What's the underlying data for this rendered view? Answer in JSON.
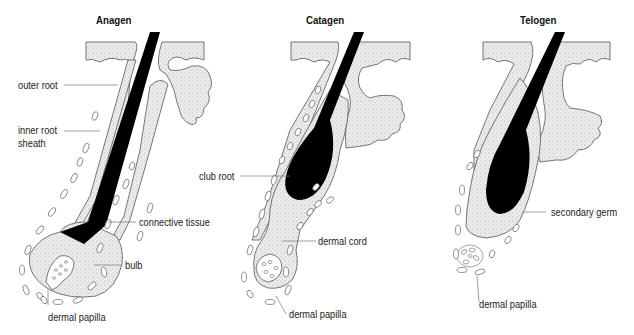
{
  "figure": {
    "panels": [
      {
        "title": "Anagen",
        "labels": [
          "outer root",
          "inner root\nsheath",
          "connective tissue",
          "bulb",
          "dermal papilla"
        ]
      },
      {
        "title": "Catagen",
        "labels": [
          "club root",
          "dermal cord",
          "dermal papilla"
        ]
      },
      {
        "title": "Telogen",
        "labels": [
          "secondary germ",
          "dermal papilla"
        ]
      }
    ]
  },
  "anagen": {
    "title": "Anagen",
    "outer_root": "outer root",
    "inner_root_line1": "inner root",
    "inner_root_line2": "sheath",
    "connective_tissue": "connective tissue",
    "bulb": "bulb",
    "dermal_papilla": "dermal papilla"
  },
  "catagen": {
    "title": "Catagen",
    "club_root": "club root",
    "dermal_cord": "dermal cord",
    "dermal_papilla": "dermal papilla"
  },
  "telogen": {
    "title": "Telogen",
    "secondary_germ": "secondary germ",
    "dermal_papilla": "dermal papilla"
  },
  "colors": {
    "tissue_fill": "#e4e4e4",
    "hair": "#000000",
    "outline": "#555555",
    "leader": "#777777"
  }
}
